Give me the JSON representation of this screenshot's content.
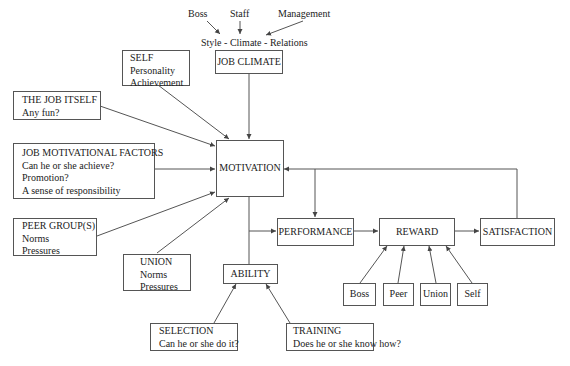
{
  "top_labels": {
    "boss": "Boss",
    "staff": "Staff",
    "management": "Management",
    "style_line": "Style - Climate - Relations"
  },
  "boxes": {
    "job_climate": {
      "title": "JOB CLIMATE"
    },
    "self": {
      "title": "SELF",
      "lines": [
        "Personality",
        "Achievement"
      ]
    },
    "job_itself": {
      "title": "THE JOB ITSELF",
      "lines": [
        "Any fun?"
      ]
    },
    "job_motivational_factors": {
      "title": "JOB MOTIVATIONAL FACTORS",
      "lines": [
        "Can he or she achieve?",
        "Promotion?",
        "A sense of responsibility"
      ]
    },
    "motivation": {
      "title": "MOTIVATION"
    },
    "peer_groups": {
      "title": "PEER GROUP(S)",
      "lines": [
        "Norms",
        "Pressures"
      ]
    },
    "union": {
      "title": "UNION",
      "lines": [
        "Norms",
        "Pressures"
      ]
    },
    "ability": {
      "title": "ABILITY"
    },
    "performance": {
      "title": "PERFORMANCE"
    },
    "reward": {
      "title": "REWARD"
    },
    "satisfaction": {
      "title": "SATISFACTION"
    },
    "selection": {
      "title": "SELECTION",
      "lines": [
        "Can he or she do it?"
      ]
    },
    "training": {
      "title": "TRAINING",
      "lines": [
        "Does he or she know how?"
      ]
    }
  },
  "reward_sources": [
    "Boss",
    "Peer",
    "Union",
    "Self"
  ],
  "colors": {
    "line": "#555555",
    "text": "#222222",
    "background": "#ffffff"
  }
}
